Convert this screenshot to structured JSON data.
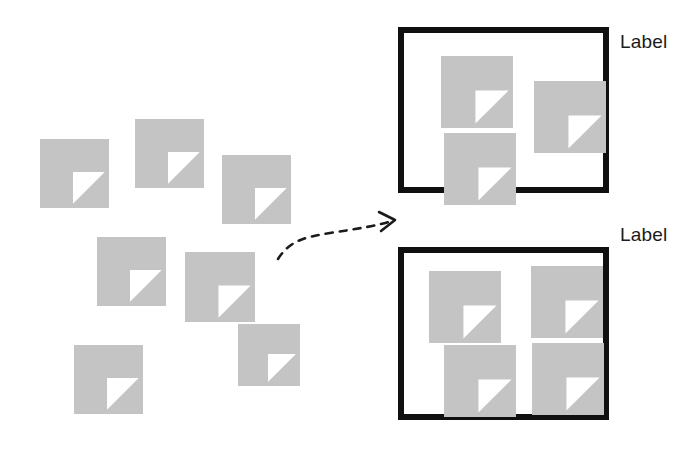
{
  "canvas": {
    "width": 698,
    "height": 451,
    "background": "#ffffff"
  },
  "theme": {
    "document_fill": "#c4c4c4",
    "document_fold": "#ffffff",
    "box_border": "#101010",
    "label_color": "#1b1b1b",
    "arrow_color": "#1b1b1b"
  },
  "unsorted_cluster": {
    "name": "scattered-documents",
    "count": 7,
    "documents": [
      {
        "id": "doc-1",
        "x": 40,
        "y": 139,
        "size": 69
      },
      {
        "id": "doc-2",
        "x": 135,
        "y": 119,
        "size": 69
      },
      {
        "id": "doc-3",
        "x": 222,
        "y": 155,
        "size": 69
      },
      {
        "id": "doc-4",
        "x": 97,
        "y": 237,
        "size": 69
      },
      {
        "id": "doc-5",
        "x": 185,
        "y": 252,
        "size": 70
      },
      {
        "id": "doc-6",
        "x": 74,
        "y": 345,
        "size": 69
      },
      {
        "id": "doc-7",
        "x": 238,
        "y": 324,
        "size": 62
      }
    ]
  },
  "arrow": {
    "name": "dashed-flow-arrow",
    "path": "M 278 259 C 290 240, 306 237, 330 233 C 356 229, 376 226, 392 221",
    "head": "M 379 212 L 395 220 L 381 231",
    "dash_pattern": "7 7",
    "stroke_width": 2.6
  },
  "groups": [
    {
      "id": "group-box-1",
      "label": "Label",
      "x": 398,
      "y": 27,
      "width": 211,
      "height": 166,
      "label_x": 620,
      "label_y": 32,
      "documents": [
        {
          "id": "g1-doc-1",
          "x": 37,
          "y": 23,
          "size": 72
        },
        {
          "id": "g1-doc-2",
          "x": 130,
          "y": 48,
          "size": 72
        },
        {
          "id": "g1-doc-3",
          "x": 40,
          "y": 100,
          "size": 72
        }
      ]
    },
    {
      "id": "group-box-2",
      "label": "Label",
      "x": 398,
      "y": 247,
      "width": 211,
      "height": 173,
      "label_x": 620,
      "label_y": 225,
      "documents": [
        {
          "id": "g2-doc-1",
          "x": 25,
          "y": 18,
          "size": 72
        },
        {
          "id": "g2-doc-2",
          "x": 127,
          "y": 13,
          "size": 72
        },
        {
          "id": "g2-doc-3",
          "x": 40,
          "y": 92,
          "size": 72
        },
        {
          "id": "g2-doc-4",
          "x": 128,
          "y": 90,
          "size": 72
        }
      ]
    }
  ]
}
